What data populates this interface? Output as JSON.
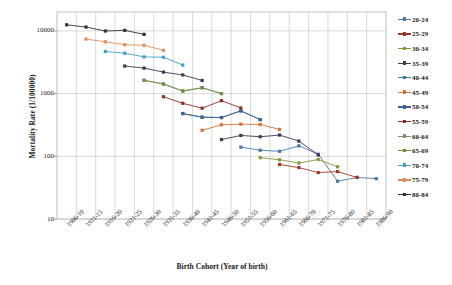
{
  "chart_data": {
    "type": "line",
    "title": "",
    "xlabel": "Birth Cohort (Year of birth)",
    "ylabel": "Mortality Rate  (1/100000)",
    "yscale": "log",
    "ylim": [
      10,
      20000
    ],
    "yticks": [
      10,
      100,
      1000,
      10000
    ],
    "ytick_labels": [
      "10",
      "100",
      "1000",
      "10000"
    ],
    "grid": true,
    "legend_position": "right",
    "categories": [
      "1906-10",
      "1911-15",
      "1916-20",
      "1921-25",
      "1926-30",
      "1931-35",
      "1936-40",
      "1941-45",
      "1946-50",
      "1951-55",
      "1956-60",
      "1961-65",
      "1966-70",
      "1971-75",
      "1976-80",
      "1981-85",
      "1986-90"
    ],
    "series": [
      {
        "name": "20-24",
        "color": "#4878a8",
        "x": [
          "1951-55",
          "1956-60",
          "1961-65",
          "1966-70",
          "1971-75",
          "1976-80",
          "1981-85",
          "1986-90"
        ],
        "values": [
          140,
          125,
          120,
          147,
          108,
          40,
          46,
          44
        ]
      },
      {
        "name": "25-29",
        "color": "#9e3a26",
        "x": [
          "1961-65",
          "1966-70",
          "1971-75",
          "1976-80",
          "1981-85"
        ],
        "values": [
          74,
          66,
          55,
          57,
          46
        ]
      },
      {
        "name": "30-34",
        "color": "#88953a",
        "x": [
          "1956-60",
          "1961-65",
          "1966-70",
          "1971-75",
          "1976-80"
        ],
        "values": [
          95,
          88,
          78,
          89,
          68
        ]
      },
      {
        "name": "35-39",
        "color": "#403852",
        "x": [
          "1946-50",
          "1951-55",
          "1956-60",
          "1961-65",
          "1966-70",
          "1971-75"
        ],
        "values": [
          185,
          215,
          205,
          218,
          175,
          105
        ]
      },
      {
        "name": "40-44",
        "color": "#3d7fa6",
        "x": [
          "1936-40",
          "1941-45",
          "1946-50",
          "1951-55",
          "1956-60"
        ],
        "values": [
          480,
          420,
          415,
          530,
          385
        ]
      },
      {
        "name": "45-49",
        "color": "#d2733a",
        "x": [
          "1941-45",
          "1946-50",
          "1951-55",
          "1956-60",
          "1961-65"
        ],
        "values": [
          260,
          318,
          325,
          322,
          268
        ]
      },
      {
        "name": "50-54",
        "color": "#3f5f8f",
        "x": [
          "1936-40",
          "1941-45",
          "1946-50",
          "1951-55",
          "1956-60"
        ],
        "values": [
          480,
          420,
          415,
          530,
          385
        ]
      },
      {
        "name": "55-59",
        "color": "#8c2f2a",
        "x": [
          "1931-35",
          "1936-40",
          "1941-45",
          "1946-50",
          "1951-55"
        ],
        "values": [
          890,
          700,
          585,
          770,
          590
        ]
      },
      {
        "name": "60-64",
        "color": "#7f8f7a",
        "x": [
          "1926-30",
          "1931-35",
          "1936-40",
          "1941-45",
          "1946-50"
        ],
        "values": [
          1630,
          1420,
          1100,
          1240,
          1000
        ]
      },
      {
        "name": "65-69",
        "color": "#6f8f3c",
        "x": [
          "1926-30",
          "1931-35",
          "1936-40",
          "1941-45",
          "1946-50"
        ],
        "values": [
          1630,
          1420,
          1100,
          1240,
          1000
        ]
      },
      {
        "name": "70-74",
        "color": "#44a0c4",
        "x": [
          "1916-20",
          "1921-25",
          "1926-30",
          "1931-35",
          "1936-40"
        ],
        "values": [
          4700,
          4400,
          3850,
          3800,
          2850
        ]
      },
      {
        "name": "75-79",
        "color": "#e08f5a",
        "x": [
          "1911-15",
          "1916-20",
          "1921-25",
          "1926-30",
          "1931-35"
        ],
        "values": [
          7400,
          6700,
          6000,
          5900,
          4900
        ]
      },
      {
        "name": "80-84",
        "color": "#2e2e38",
        "x": [
          "1906-10",
          "1911-15",
          "1916-20",
          "1921-25",
          "1926-30"
        ],
        "values": [
          12500,
          11500,
          9950,
          10200,
          8800
        ]
      }
    ],
    "extra_series": [
      {
        "name": "35-39-upper",
        "color": "#403852",
        "x": [
          "1921-25",
          "1926-30",
          "1931-35",
          "1936-40",
          "1941-45"
        ],
        "values": [
          2750,
          2550,
          2200,
          1980,
          1620
        ]
      }
    ]
  },
  "legend": {
    "items": [
      {
        "label": "20-24",
        "color": "#4878a8"
      },
      {
        "label": "25-29",
        "color": "#9e3a26"
      },
      {
        "label": "30-34",
        "color": "#88953a"
      },
      {
        "label": "35-39",
        "color": "#403852"
      },
      {
        "label": "40-44",
        "color": "#3d7fa6"
      },
      {
        "label": "45-49",
        "color": "#d2733a"
      },
      {
        "label": "50-54",
        "color": "#3f5f8f"
      },
      {
        "label": "55-59",
        "color": "#8c2f2a"
      },
      {
        "label": "60-64",
        "color": "#7f8f7a"
      },
      {
        "label": "65-69",
        "color": "#6f8f3c"
      },
      {
        "label": "70-74",
        "color": "#44a0c4"
      },
      {
        "label": "75-79",
        "color": "#e08f5a"
      },
      {
        "label": "80-84",
        "color": "#2e2e38"
      }
    ]
  },
  "axes": {
    "grid_color": "#c9c9c9",
    "frame_color": "#b0b0b0",
    "text_color": "#1a1a1a"
  }
}
